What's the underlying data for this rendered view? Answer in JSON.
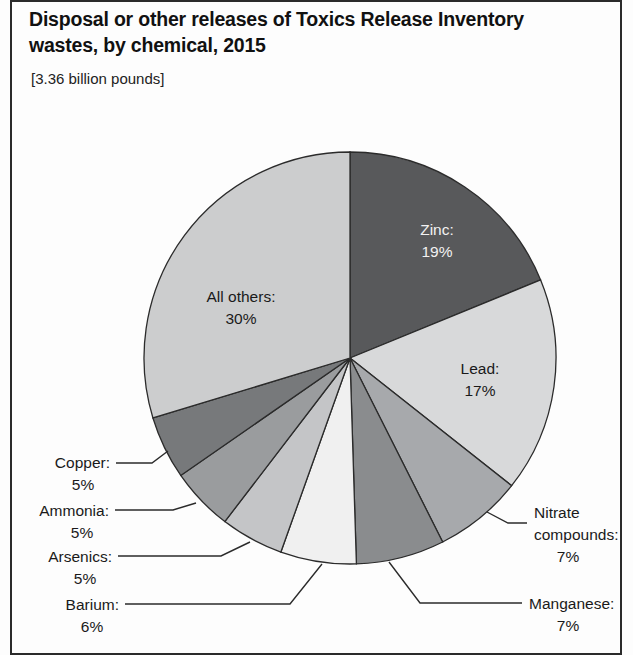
{
  "figure": {
    "title": "Disposal or other releases of Toxics Release Inventory wastes, by chemical, 2015",
    "subtitle": "[3.36 billion pounds]"
  },
  "chart_data": {
    "type": "pie",
    "title": "Disposal or other releases of Toxics Release Inventory wastes, by chemical, 2015",
    "subtitle": "[3.36 billion pounds]",
    "total": "3.36 billion pounds",
    "units": "percent of total",
    "start_angle_deg": 0,
    "direction": "clockwise",
    "legend": "none (direct labels with leader lines)",
    "categories": [
      "Zinc",
      "Lead",
      "Nitrate compounds",
      "Manganese",
      "Barium",
      "Arsenics",
      "Ammonia",
      "Copper",
      "All others"
    ],
    "values": [
      19,
      17,
      7,
      7,
      6,
      5,
      5,
      5,
      30
    ],
    "slices": [
      {
        "name": "Zinc",
        "label": "Zinc:",
        "percent": "19%",
        "value": 19,
        "color": "#58595b",
        "label_placement": "inside",
        "label_color": "#f2f2f2"
      },
      {
        "name": "Lead",
        "label": "Lead:",
        "percent": "17%",
        "value": 17,
        "color": "#d8d9da",
        "label_placement": "inside",
        "label_color": "#1a1a1a"
      },
      {
        "name": "Nitrate compounds",
        "label": "Nitrate",
        "label_line2": "compounds:",
        "percent": "7%",
        "value": 7,
        "color": "#a7a9ac",
        "label_placement": "callout-right"
      },
      {
        "name": "Manganese",
        "label": "Manganese:",
        "percent": "7%",
        "value": 7,
        "color": "#8a8c8e",
        "label_placement": "callout-right"
      },
      {
        "name": "Barium",
        "label": "Barium:",
        "percent": "6%",
        "value": 6,
        "color": "#f0f0f0",
        "label_placement": "callout-left"
      },
      {
        "name": "Arsenics",
        "label": "Arsenics:",
        "percent": "5%",
        "value": 5,
        "color": "#c4c5c7",
        "label_placement": "callout-left"
      },
      {
        "name": "Ammonia",
        "label": "Ammonia:",
        "percent": "5%",
        "value": 5,
        "color": "#9a9c9e",
        "label_placement": "callout-left"
      },
      {
        "name": "Copper",
        "label": "Copper:",
        "percent": "5%",
        "value": 5,
        "color": "#77797b",
        "label_placement": "callout-left"
      },
      {
        "name": "All others",
        "label": "All others:",
        "percent": "30%",
        "value": 30,
        "color": "#cccdce",
        "label_placement": "inside",
        "label_color": "#1a1a1a"
      }
    ],
    "geometry": {
      "center_x": 350,
      "center_y": 358,
      "radius": 206
    },
    "colors": {
      "outline": "#2b2b2b",
      "background": "#ffffff"
    }
  }
}
